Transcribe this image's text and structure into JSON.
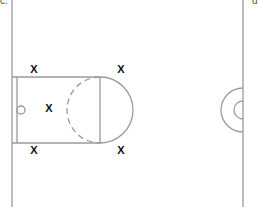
{
  "labels": {
    "top_left": "c.",
    "top_right": "d"
  },
  "colors": {
    "line": "#9a9a9a",
    "marker": "#111111",
    "background": "#ffffff"
  },
  "court": {
    "baseline_x": 12,
    "right_line_x": 243,
    "lane": {
      "x": 12,
      "y": 77,
      "width": 88,
      "height": 66
    },
    "backboard_x": 17,
    "rim": {
      "cx": 21,
      "cy": 110,
      "r": 4
    },
    "free_throw_circle": {
      "cx": 100,
      "cy": 110,
      "r": 33
    },
    "center_circle": {
      "cx": 243,
      "cy": 110,
      "r_outer": 22,
      "r_inner": 9
    }
  },
  "markers": [
    {
      "id": "player-top-left",
      "symbol": "X",
      "x": 34,
      "y": 69
    },
    {
      "id": "player-top-right",
      "symbol": "X",
      "x": 121,
      "y": 69
    },
    {
      "id": "player-lane",
      "symbol": "X",
      "x": 49,
      "y": 108
    },
    {
      "id": "player-bottom-left",
      "symbol": "X",
      "x": 34,
      "y": 150
    },
    {
      "id": "player-bottom-right",
      "symbol": "X",
      "x": 121,
      "y": 150
    }
  ]
}
